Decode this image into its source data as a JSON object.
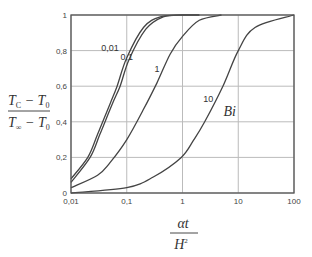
{
  "chart_data": {
    "type": "line",
    "title": "",
    "xlabel": "αt / H²",
    "ylabel": "(T_C − T_0) / (T_∞ − T_0)",
    "xscale": "log",
    "xlim": [
      0.01,
      100
    ],
    "ylim": [
      0,
      1
    ],
    "grid": true,
    "x_ticks": [
      "0,01",
      "0,1",
      "1",
      "10",
      "100"
    ],
    "y_ticks": [
      "0",
      "0,2",
      "0,4",
      "0,6",
      "0,8",
      "1"
    ],
    "legend_title": "Bi",
    "series": [
      {
        "name": "0,01",
        "x": [
          0.01,
          0.02,
          0.03,
          0.05,
          0.067,
          0.1,
          0.2,
          0.4,
          1,
          2
        ],
        "y": [
          0.08,
          0.2,
          0.33,
          0.5,
          0.6,
          0.76,
          0.93,
          0.99,
          1.0,
          1.0
        ]
      },
      {
        "name": "0,1",
        "x": [
          0.01,
          0.022,
          0.033,
          0.055,
          0.076,
          0.11,
          0.22,
          0.45,
          1,
          2
        ],
        "y": [
          0.06,
          0.2,
          0.33,
          0.5,
          0.6,
          0.75,
          0.92,
          0.99,
          1.0,
          1.0
        ]
      },
      {
        "name": "1",
        "x": [
          0.01,
          0.03,
          0.05,
          0.1,
          0.2,
          0.35,
          0.6,
          1,
          2,
          5
        ],
        "y": [
          0.03,
          0.1,
          0.17,
          0.3,
          0.47,
          0.62,
          0.78,
          0.88,
          0.97,
          1.0
        ]
      },
      {
        "name": "10",
        "x": [
          0.01,
          0.1,
          0.3,
          0.95,
          1.6,
          2.5,
          5.3,
          10,
          20,
          100
        ],
        "y": [
          0.0,
          0.03,
          0.09,
          0.2,
          0.3,
          0.4,
          0.6,
          0.8,
          0.93,
          1.0
        ]
      }
    ],
    "annotations": [
      {
        "text": "0,01",
        "x": 0.05,
        "y": 0.8
      },
      {
        "text": "0,1",
        "x": 0.1,
        "y": 0.75
      },
      {
        "text": "1",
        "x": 0.35,
        "y": 0.68
      },
      {
        "text": "10",
        "x": 2.9,
        "y": 0.51
      },
      {
        "text": "Bi",
        "x": 7,
        "y": 0.43
      }
    ]
  },
  "labels": {
    "y_num_T": "T",
    "y_num_sub": "C",
    "y_num_minus": " − T",
    "y_num_sub2": "0",
    "y_den_T": "T",
    "y_den_sub": "∞",
    "y_den_minus": " − T",
    "y_den_sub2": "0",
    "x_num": "αt",
    "x_den": "H",
    "x_den_sup": "2"
  }
}
